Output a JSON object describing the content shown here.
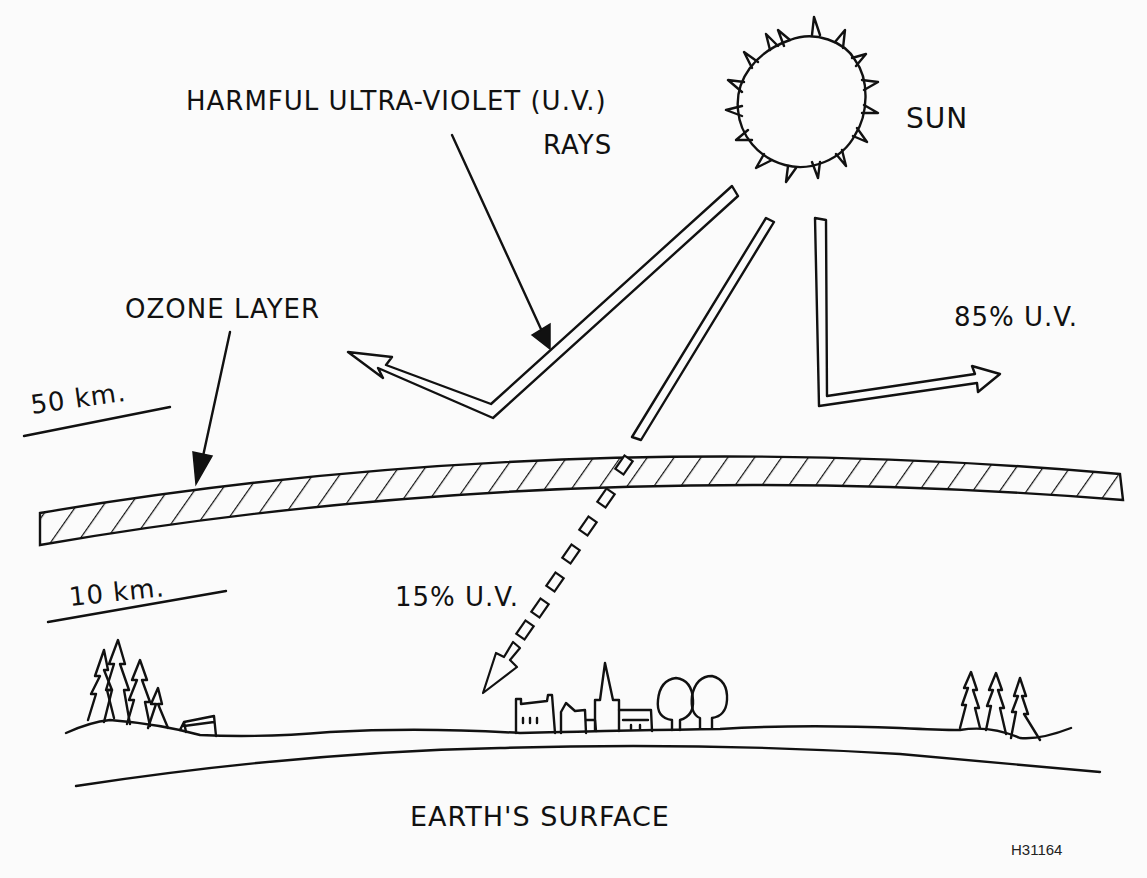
{
  "diagram": {
    "labels": {
      "uv_rays_line1": "HARMFUL ULTRA-VIOLET (U.V.)",
      "uv_rays_line2": "RAYS",
      "sun": "SUN",
      "ozone_layer": "OZONE LAYER",
      "altitude_top": "50 km.",
      "altitude_bottom": "10 km.",
      "reflected_uv": "85% U.V.",
      "transmitted_uv": "15% U.V.",
      "earth_surface": "EARTH'S SURFACE",
      "figure_code": "H31164"
    },
    "nodes": [
      {
        "id": "sun",
        "label": "SUN"
      },
      {
        "id": "ozone",
        "label": "OZONE LAYER"
      },
      {
        "id": "earth",
        "label": "EARTH'S SURFACE"
      }
    ],
    "edges": [
      {
        "from": "sun",
        "to": "ozone",
        "label": "HARMFUL ULTRA-VIOLET (U.V.) RAYS"
      },
      {
        "from": "ozone",
        "to": "space",
        "label": "85% U.V.",
        "type": "reflected"
      },
      {
        "from": "ozone",
        "to": "earth",
        "label": "15% U.V.",
        "type": "transmitted"
      }
    ],
    "colors": {
      "ink": "#111111",
      "paper": "#fbfbfb"
    }
  }
}
